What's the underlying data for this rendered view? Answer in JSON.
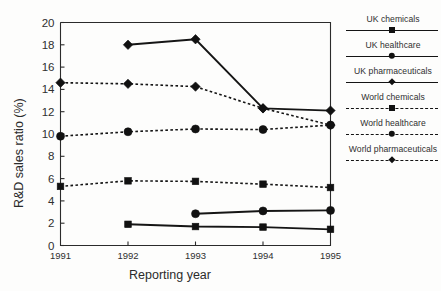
{
  "chart_data": {
    "type": "line",
    "title": "",
    "xlabel": "Reporting year",
    "ylabel": "R&D sales ratio (%)",
    "x": [
      1991,
      1992,
      1993,
      1994,
      1995
    ],
    "xticklabels": [
      "1991",
      "1992",
      "1993",
      "1994",
      "1995"
    ],
    "yticklabels": [
      "0",
      "2",
      "4",
      "6",
      "8",
      "10",
      "12",
      "14",
      "16",
      "18",
      "20"
    ],
    "yticks": [
      0,
      2,
      4,
      6,
      8,
      10,
      12,
      14,
      16,
      18,
      20
    ],
    "ylim": [
      0,
      20
    ],
    "xlim": [
      1991,
      1995
    ],
    "grid": false,
    "legend_position": "right",
    "series": [
      {
        "name": "UK chemicals",
        "marker": "square",
        "linestyle": "solid",
        "color": "#111111",
        "x": [
          1992,
          1993,
          1994,
          1995
        ],
        "values": [
          1.9,
          1.7,
          1.65,
          1.45
        ]
      },
      {
        "name": "UK healthcare",
        "marker": "circle",
        "linestyle": "solid",
        "color": "#111111",
        "x": [
          1993,
          1994,
          1995
        ],
        "values": [
          2.85,
          3.1,
          3.15
        ]
      },
      {
        "name": "UK pharmaceuticals",
        "marker": "diamond",
        "linestyle": "solid",
        "color": "#111111",
        "x": [
          1992,
          1993,
          1994,
          1995
        ],
        "values": [
          18.0,
          18.5,
          12.3,
          12.1
        ]
      },
      {
        "name": "World chemicals",
        "marker": "square",
        "linestyle": "dashed",
        "color": "#111111",
        "x": [
          1991,
          1992,
          1993,
          1994,
          1995
        ],
        "values": [
          5.3,
          5.8,
          5.75,
          5.5,
          5.2
        ]
      },
      {
        "name": "World healthcare",
        "marker": "circle",
        "linestyle": "dashed",
        "color": "#111111",
        "x": [
          1991,
          1992,
          1993,
          1994,
          1995
        ],
        "values": [
          9.8,
          10.2,
          10.45,
          10.4,
          10.8
        ]
      },
      {
        "name": "World pharmaceuticals",
        "marker": "diamond",
        "linestyle": "dashed",
        "color": "#111111",
        "x": [
          1991,
          1992,
          1993,
          1994,
          1995
        ],
        "values": [
          14.6,
          14.5,
          14.25,
          12.3,
          10.8
        ]
      }
    ]
  },
  "legend": {
    "entries": [
      {
        "label": "UK chemicals",
        "marker": "square",
        "linestyle": "solid"
      },
      {
        "label": "UK healthcare",
        "marker": "circle",
        "linestyle": "solid"
      },
      {
        "label": "UK pharmaceuticals",
        "marker": "diamond",
        "linestyle": "solid"
      },
      {
        "label": "World chemicals",
        "marker": "square",
        "linestyle": "dashed"
      },
      {
        "label": "World healthcare",
        "marker": "circle",
        "linestyle": "dashed"
      },
      {
        "label": "World pharmaceuticals",
        "marker": "diamond",
        "linestyle": "dashed"
      }
    ]
  },
  "axes": {
    "x_title": "Reporting year",
    "y_title": "R&D sales ratio (%)"
  },
  "colors": {
    "ink": "#111111",
    "axis": "#2b2b2b",
    "background": "#fdfdfc"
  }
}
